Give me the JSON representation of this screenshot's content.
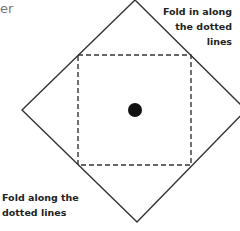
{
  "header": {
    "partial_title": "er"
  },
  "diagram": {
    "outer_shape": "diamond",
    "outer_vertices": {
      "top": [
        135,
        0
      ],
      "right": [
        246,
        110
      ],
      "bottom": [
        137,
        222
      ],
      "left": [
        22,
        110
      ]
    },
    "inner_shape": "dashed-square",
    "inner_square": {
      "x": 78,
      "y": 55,
      "width": 113,
      "height": 110
    },
    "center_dot": {
      "cx": 135,
      "cy": 110,
      "r": 7
    },
    "stroke_color": "#333333",
    "dot_color": "#111111"
  },
  "annotations": {
    "top_right": {
      "lines": [
        "Fold in along",
        "the dotted",
        "lines"
      ]
    },
    "bottom_left": {
      "lines": [
        "Fold along the",
        "dotted lines"
      ]
    }
  }
}
